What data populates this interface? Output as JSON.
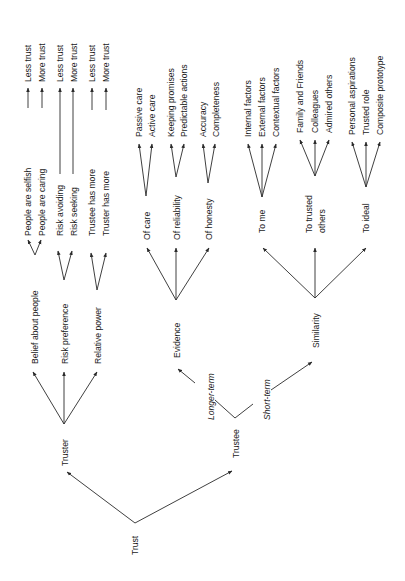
{
  "diagram": {
    "root": "Trust",
    "nodes": {
      "trust": "Trust",
      "truster": "Truster",
      "trustee": "Trustee",
      "belief_about_people": "Belief about people",
      "risk_preference": "Risk preference",
      "relative_power": "Relative power",
      "people_selfish": "People are selfish",
      "people_caring": "People are caring",
      "risk_avoiding": "Risk avoiding",
      "risk_seeking": "Risk seeking",
      "trustee_has_more": "Trustee has more",
      "truster_has_more": "Truster has more",
      "less_trust_1": "Less trust",
      "more_trust_1": "More trust",
      "less_trust_2": "Less trust",
      "more_trust_2": "More trust",
      "less_trust_3": "Less trust",
      "more_trust_3": "More trust",
      "longer_term": "Longer-term",
      "short_term": "Short-term",
      "evidence": "Evidence",
      "of_care": "Of care",
      "of_reliability": "Of reliability",
      "of_honesty": "Of honesty",
      "passive_care": "Passive care",
      "active_care": "Active care",
      "keeping_promises": "Keeping promises",
      "predictable_actions": "Predictable actions",
      "accuracy": "Accuracy",
      "completeness": "Completeness",
      "similarity": "Similarity",
      "to_me": "To me",
      "to_trusted_1": "To trusted",
      "to_trusted_2": "others",
      "to_ideal": "To ideal",
      "internal_factors": "Internal factors",
      "external_factors": "External factors",
      "contextual_factors": "Contextual factors",
      "family_friends": "Family and Friends",
      "colleagues": "Colleagues",
      "admired_others": "Admired others",
      "personal_aspirations": "Personal aspirations",
      "trusted_role": "Trusted role",
      "composite_prototype": "Composite prototype"
    },
    "colors": {
      "line": "#2a2a2a",
      "text": "#1a1a1a",
      "background": "#ffffff"
    },
    "orientation": "rotated 90° counter-clockwise (tree grows upward)"
  }
}
